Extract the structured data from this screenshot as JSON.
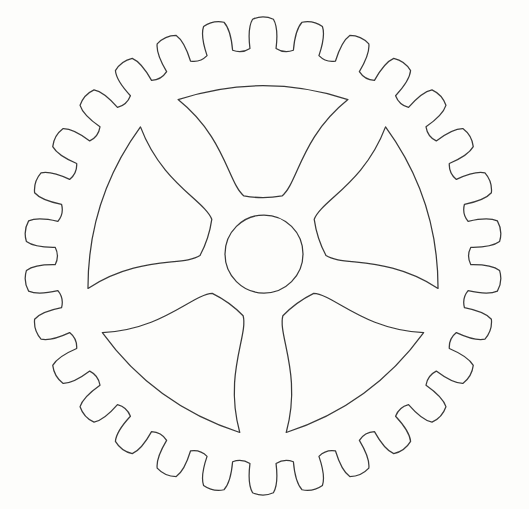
{
  "image": {
    "title": "Gear Wheel Line Drawing",
    "subject": "sprocket-gear",
    "style": "black outline line art on white background",
    "width": 529,
    "height": 509
  },
  "colors": {
    "background": "#fdfdfb",
    "stroke": "#3a3a3a",
    "fill": "none"
  },
  "geometry": {
    "center_x": 263,
    "center_y": 256,
    "outer_radius": 237,
    "root_radius": 208,
    "rim_inner_radius": 190,
    "hub_radius": 39,
    "hub_center_x": 264,
    "hub_center_y": 254,
    "tooth_count": 30,
    "spoke_count": 5,
    "spoke_window_count": 5,
    "spoke_rotation_offset_deg": -90,
    "spoke_arm_half_width_deg": 7.5,
    "window_corner_radius": 16,
    "stroke_width": 1.25
  },
  "parts": [
    {
      "name": "outer-rim-teeth",
      "label": "Toothed outer rim"
    },
    {
      "name": "hub-circle",
      "label": "Center hub bore"
    },
    {
      "name": "spoke-window-top",
      "label": "Spoke opening - top"
    },
    {
      "name": "spoke-window-upper-right",
      "label": "Spoke opening - upper right"
    },
    {
      "name": "spoke-window-lower-right",
      "label": "Spoke opening - lower right"
    },
    {
      "name": "spoke-window-lower-left",
      "label": "Spoke opening - lower left"
    },
    {
      "name": "spoke-window-upper-left",
      "label": "Spoke opening - upper left"
    }
  ],
  "chart_data": {
    "type": "line",
    "xlabel": "",
    "ylabel": "",
    "categories": [
      "teeth",
      "spokes",
      "windows",
      "hub"
    ],
    "values": [
      30,
      5,
      5,
      1
    ]
  }
}
